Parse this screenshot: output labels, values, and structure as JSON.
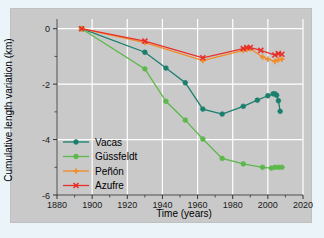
{
  "figure": {
    "background_color": "#eaf4f9",
    "panel_color": "#c9c9c9",
    "grid_color": "#ffffff"
  },
  "chart_data": {
    "type": "line",
    "title": "",
    "xlabel": "Time (years)",
    "ylabel": "Cumulative length variation (km)",
    "xlim": [
      1880,
      2020
    ],
    "ylim": [
      -6,
      0.35
    ],
    "xticks": [
      1880,
      1900,
      1920,
      1940,
      1960,
      1980,
      2000,
      2020
    ],
    "yticks": [
      0,
      -2,
      -4,
      -6
    ],
    "xminorticks": [
      1890,
      1910,
      1930,
      1950,
      1970,
      1990,
      2010
    ],
    "yminorticks": [
      -1,
      -3,
      -5
    ],
    "grid": true,
    "legend_position": "lower left",
    "series": [
      {
        "name": "Vacas",
        "color": "#1b7f6e",
        "marker": "circle",
        "x": [
          1894,
          1930,
          1942,
          1953,
          1963,
          1974,
          1986,
          1994,
          2000,
          2003,
          2004,
          2005,
          2006,
          2007
        ],
        "y": [
          0.0,
          -0.85,
          -1.42,
          -1.95,
          -2.9,
          -3.08,
          -2.8,
          -2.58,
          -2.42,
          -2.35,
          -2.35,
          -2.4,
          -2.6,
          -2.98
        ]
      },
      {
        "name": "Güssfeldt",
        "color": "#5cb84a",
        "marker": "circle",
        "x": [
          1894,
          1930,
          1942,
          1953,
          1963,
          1974,
          1986,
          1997,
          2002,
          2004,
          2006,
          2008
        ],
        "y": [
          0.0,
          -1.45,
          -2.62,
          -3.3,
          -3.98,
          -4.68,
          -4.88,
          -5.0,
          -5.03,
          -5.0,
          -5.0,
          -5.0
        ]
      },
      {
        "name": "Peñón",
        "color": "#f28b27",
        "marker": "plus",
        "x": [
          1894,
          1930,
          1963,
          1986,
          1988,
          1990,
          1997,
          2000,
          2004,
          2006,
          2008
        ],
        "y": [
          0.0,
          -0.5,
          -1.15,
          -0.78,
          -0.75,
          -0.72,
          -1.02,
          -1.1,
          -1.18,
          -1.12,
          -1.1
        ]
      },
      {
        "name": "Azufre",
        "color": "#e8302a",
        "marker": "x",
        "x": [
          1894,
          1930,
          1963,
          1986,
          1988,
          1990,
          1996,
          2004,
          2006,
          2008
        ],
        "y": [
          0.0,
          -0.45,
          -1.05,
          -0.72,
          -0.68,
          -0.68,
          -0.78,
          -0.95,
          -0.9,
          -0.92
        ]
      }
    ]
  },
  "legend": {
    "items": [
      {
        "label": "Vacas",
        "color": "#1b7f6e",
        "marker": "circle"
      },
      {
        "label": "Güssfeldt",
        "color": "#5cb84a",
        "marker": "circle"
      },
      {
        "label": "Peñón",
        "color": "#f28b27",
        "marker": "plus"
      },
      {
        "label": "Azufre",
        "color": "#e8302a",
        "marker": "x"
      }
    ]
  },
  "axes": {
    "x_tick_labels": [
      "1880",
      "1900",
      "1920",
      "1940",
      "1960",
      "1980",
      "2000",
      "2020"
    ],
    "y_tick_labels": [
      "0",
      "-2",
      "-4",
      "-6"
    ],
    "x_title": "Time (years)",
    "y_title": "Cumulative length variation (km)"
  }
}
